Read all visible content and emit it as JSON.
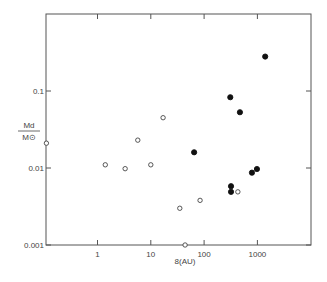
{
  "chart_data": {
    "type": "scatter",
    "title": "",
    "xlabel": "8(AU)",
    "ylabel_numerator": "Md",
    "ylabel_denominator": "M⊙",
    "xscale": "log",
    "yscale": "log",
    "xlim": [
      0.11,
      10000
    ],
    "ylim": [
      0.001,
      1.05
    ],
    "grid": false,
    "legend": null,
    "x_ticks": [
      {
        "value": 1,
        "label": "1"
      },
      {
        "value": 10,
        "label": "10"
      },
      {
        "value": 100,
        "label": "100"
      },
      {
        "value": 1000,
        "label": "1000"
      }
    ],
    "y_ticks": [
      {
        "value": 0.1,
        "label": "0.1"
      },
      {
        "value": 0.01,
        "label": "0.01"
      },
      {
        "value": 0.001,
        "label": "0.001"
      }
    ],
    "series": [
      {
        "name": "open",
        "marker": "open-circle",
        "points": [
          {
            "x": 0.11,
            "y": 0.021
          },
          {
            "x": 1.4,
            "y": 0.011
          },
          {
            "x": 3.3,
            "y": 0.0098
          },
          {
            "x": 5.7,
            "y": 0.023
          },
          {
            "x": 10,
            "y": 0.011
          },
          {
            "x": 17,
            "y": 0.045
          },
          {
            "x": 35,
            "y": 0.003
          },
          {
            "x": 44,
            "y": 0.001
          },
          {
            "x": 84,
            "y": 0.0038
          },
          {
            "x": 430,
            "y": 0.0049
          }
        ]
      },
      {
        "name": "filled",
        "marker": "filled-circle",
        "points": [
          {
            "x": 65,
            "y": 0.016
          },
          {
            "x": 310,
            "y": 0.083
          },
          {
            "x": 470,
            "y": 0.053
          },
          {
            "x": 1400,
            "y": 0.28
          },
          {
            "x": 320,
            "y": 0.0058
          },
          {
            "x": 320,
            "y": 0.0049
          },
          {
            "x": 790,
            "y": 0.0087
          },
          {
            "x": 980,
            "y": 0.0097
          }
        ]
      }
    ]
  },
  "colors": {
    "axis": "#555555",
    "marker": "#111111",
    "background": "#ffffff"
  }
}
